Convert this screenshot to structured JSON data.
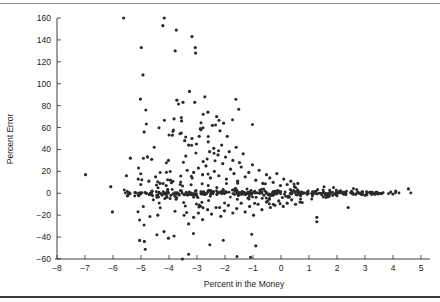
{
  "chart_data": {
    "type": "scatter",
    "title": "",
    "xlabel": "Percent in the Money",
    "ylabel": "Percent Error",
    "xlim": [
      -8,
      5
    ],
    "ylim": [
      -60,
      160
    ],
    "xticks": [
      -8,
      -7,
      -6,
      -5,
      -4,
      -3,
      -2,
      -1,
      0,
      1,
      2,
      3,
      4,
      5
    ],
    "xticklabels": [
      "-8",
      "-7",
      "-6",
      "-5",
      "-4",
      "-3",
      "-2",
      "-1",
      "0",
      "1",
      "2",
      "3",
      "4",
      "5"
    ],
    "yticks": [
      -60,
      -40,
      -20,
      0,
      20,
      40,
      60,
      80,
      100,
      120,
      140,
      160
    ],
    "yticklabels": [
      "-60",
      "-40",
      "-20",
      "0",
      "20",
      "40",
      "60",
      "80",
      "100",
      "120",
      "140",
      "160"
    ],
    "grid": false,
    "legend": null,
    "marker": "dot",
    "marker_color": "#2a2a2a",
    "marker_size": 1.6,
    "n_points": 612,
    "points": [
      [
        -5.62,
        160
      ],
      [
        -4.17,
        160
      ],
      [
        -4.22,
        153
      ],
      [
        -3.74,
        149
      ],
      [
        -4.99,
        133
      ],
      [
        -3.18,
        143
      ],
      [
        -3.06,
        133
      ],
      [
        -3.05,
        128
      ],
      [
        -3.78,
        130
      ],
      [
        -4.93,
        108
      ],
      [
        -3.27,
        93
      ],
      [
        -5.02,
        86
      ],
      [
        -3.72,
        85
      ],
      [
        -3.5,
        83
      ],
      [
        -3.08,
        83
      ],
      [
        -2.72,
        88
      ],
      [
        -2.61,
        74
      ],
      [
        -3.82,
        68
      ],
      [
        -2.88,
        59
      ],
      [
        -2.86,
        58
      ],
      [
        -3.55,
        66
      ],
      [
        -4.89,
        56
      ],
      [
        -3.88,
        53
      ],
      [
        -3.56,
        55
      ],
      [
        -3.44,
        48
      ],
      [
        -3.18,
        50
      ],
      [
        -3.3,
        44
      ],
      [
        -2.92,
        52
      ],
      [
        -3.02,
        45
      ],
      [
        -2.6,
        47
      ],
      [
        -2.45,
        62
      ],
      [
        -2.3,
        70
      ],
      [
        -2.18,
        57
      ],
      [
        -2.05,
        64
      ],
      [
        -1.92,
        52
      ],
      [
        -2.55,
        38
      ],
      [
        -2.4,
        41
      ],
      [
        -2.25,
        35
      ],
      [
        -2.12,
        44
      ],
      [
        -1.98,
        33
      ],
      [
        -1.85,
        38
      ],
      [
        -1.72,
        30
      ],
      [
        -1.6,
        42
      ],
      [
        -1.48,
        28
      ],
      [
        -1.35,
        36
      ],
      [
        -5.38,
        32
      ],
      [
        -4.62,
        31
      ],
      [
        -4.02,
        30
      ],
      [
        -3.4,
        34
      ],
      [
        -2.78,
        29
      ],
      [
        -6.98,
        17
      ],
      [
        -6.08,
        6
      ],
      [
        -5.52,
        16
      ],
      [
        -5.1,
        13
      ],
      [
        -4.72,
        11
      ],
      [
        -4.48,
        15
      ],
      [
        -4.32,
        9
      ],
      [
        -4.1,
        7
      ],
      [
        -3.95,
        12
      ],
      [
        -3.6,
        8
      ],
      [
        -3.35,
        21
      ],
      [
        -3.12,
        19
      ],
      [
        -2.95,
        23
      ],
      [
        -2.8,
        17
      ],
      [
        -2.68,
        25
      ],
      [
        -2.52,
        14
      ],
      [
        -2.38,
        20
      ],
      [
        -2.22,
        16
      ],
      [
        -2.08,
        27
      ],
      [
        -1.95,
        13
      ],
      [
        -1.8,
        22
      ],
      [
        -1.68,
        18
      ],
      [
        -1.55,
        11
      ],
      [
        -1.42,
        24
      ],
      [
        -1.28,
        15
      ],
      [
        -1.15,
        19
      ],
      [
        -1.02,
        26
      ],
      [
        -0.9,
        12
      ],
      [
        -0.78,
        21
      ],
      [
        -0.65,
        9
      ],
      [
        -0.52,
        17
      ],
      [
        -0.4,
        14
      ],
      [
        -0.28,
        10
      ],
      [
        -0.15,
        18
      ],
      [
        -0.02,
        7
      ],
      [
        0.1,
        13
      ],
      [
        0.22,
        8
      ],
      [
        0.35,
        11
      ],
      [
        0.48,
        6
      ],
      [
        0.6,
        9
      ],
      [
        -6.02,
        -17
      ],
      [
        -5.05,
        -43
      ],
      [
        -4.88,
        -44
      ],
      [
        -4.4,
        -20
      ],
      [
        -4.18,
        -35
      ],
      [
        -4.02,
        -41
      ],
      [
        -3.82,
        -39
      ],
      [
        -3.52,
        -60
      ],
      [
        -3.3,
        -28
      ],
      [
        -3.12,
        -22
      ],
      [
        -2.95,
        -18
      ],
      [
        -2.8,
        -24
      ],
      [
        -2.62,
        -15
      ],
      [
        -2.48,
        -19
      ],
      [
        -2.32,
        -13
      ],
      [
        -2.15,
        -21
      ],
      [
        -2.02,
        -16
      ],
      [
        -1.88,
        -11
      ],
      [
        -1.72,
        -18
      ],
      [
        -1.58,
        -14
      ],
      [
        -1.42,
        -9
      ],
      [
        -1.28,
        -17
      ],
      [
        -1.12,
        -12
      ],
      [
        -0.98,
        -20
      ],
      [
        -0.82,
        -10
      ],
      [
        -0.68,
        -15
      ],
      [
        -0.52,
        -8
      ],
      [
        -0.38,
        -13
      ],
      [
        -0.22,
        -11
      ],
      [
        -0.08,
        -7
      ],
      [
        0.08,
        -12
      ],
      [
        0.22,
        -9
      ],
      [
        0.38,
        -6
      ],
      [
        0.52,
        -10
      ],
      [
        0.68,
        -8
      ],
      [
        -0.9,
        -48
      ],
      [
        1.28,
        -22
      ],
      [
        1.28,
        -26
      ],
      [
        2.4,
        -13
      ],
      [
        4.55,
        4
      ],
      [
        4.1,
        2
      ],
      [
        3.92,
        1
      ],
      [
        3.58,
        0
      ],
      [
        3.4,
        1
      ],
      [
        3.2,
        0
      ]
    ],
    "dense_band_note": "Several hundred additional markers form a near-solid line at y=0 spanning x=-5.5 to +3.5."
  },
  "axis_titles": {
    "x": "Percent in the Money",
    "y": "Percent Error"
  }
}
